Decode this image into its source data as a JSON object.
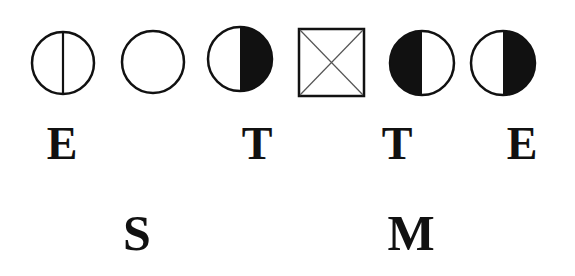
{
  "symbols": [
    {
      "type": "circle",
      "fill": "empty-with-vertical-line",
      "name": "circle-divided"
    },
    {
      "type": "circle",
      "fill": "empty",
      "name": "circle-empty"
    },
    {
      "type": "circle",
      "fill": "right-half-black",
      "name": "circle-right-half-filled"
    },
    {
      "type": "square",
      "fill": "crossed",
      "name": "square-crossed"
    },
    {
      "type": "circle",
      "fill": "left-half-black",
      "name": "circle-left-half-filled"
    },
    {
      "type": "circle",
      "fill": "right-half-black",
      "name": "circle-right-half-filled"
    }
  ],
  "labels_row1": [
    "E",
    "T",
    "T",
    "E"
  ],
  "labels_row2": [
    "S",
    "M"
  ],
  "colors": {
    "ink": "#111111",
    "background": "#ffffff",
    "cross": "#555555"
  }
}
